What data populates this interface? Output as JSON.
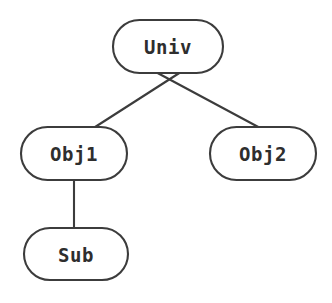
{
  "diagram": {
    "type": "tree",
    "background_color": "#ffffff",
    "stroke_color": "#3c3c3c",
    "text_color": "#2e2e2e",
    "node_shape": "stadium",
    "nodes": [
      {
        "id": "univ",
        "label": "Univ",
        "level": 0,
        "cx": 168,
        "cy": 46,
        "width": 110,
        "height": 53
      },
      {
        "id": "obj1",
        "label": "Obj1",
        "level": 1,
        "cx": 74,
        "cy": 153,
        "width": 106,
        "height": 53
      },
      {
        "id": "obj2",
        "label": "Obj2",
        "level": 1,
        "cx": 263,
        "cy": 153,
        "width": 106,
        "height": 53
      },
      {
        "id": "sub",
        "label": "Sub",
        "level": 2,
        "cx": 76,
        "cy": 254,
        "width": 104,
        "height": 52
      }
    ],
    "edges": [
      {
        "id": "univ-obj1",
        "from": "univ",
        "to": "obj1",
        "x1": 184,
        "y1": 70,
        "x2": 92,
        "y2": 129
      },
      {
        "id": "univ-obj2",
        "from": "univ",
        "to": "obj2",
        "x1": 152,
        "y1": 70,
        "x2": 262,
        "y2": 129
      },
      {
        "id": "obj1-sub",
        "from": "obj1",
        "to": "sub",
        "x1": 74,
        "y1": 180,
        "x2": 74,
        "y2": 229
      }
    ]
  }
}
